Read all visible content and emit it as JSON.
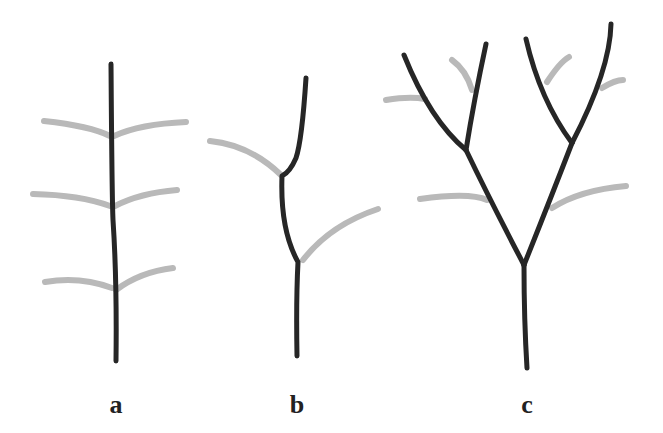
{
  "figure": {
    "panels": [
      {
        "id": "a",
        "label": "a",
        "description": "single unbranched axis with paired lateral appendages"
      },
      {
        "id": "b",
        "label": "b",
        "description": "sympodial zigzag axis with alternating lateral appendages"
      },
      {
        "id": "c",
        "label": "c",
        "description": "repeatedly dichotomous branching axis with appendages"
      }
    ],
    "colors": {
      "stem": "#262626",
      "appendage": "#b9b9b9",
      "background": "#ffffff"
    }
  }
}
